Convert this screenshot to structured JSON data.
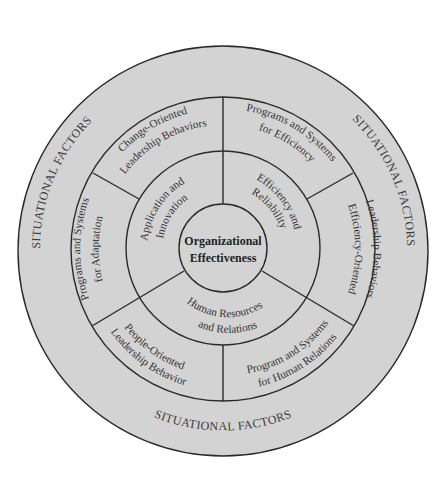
{
  "diagram": {
    "colors": {
      "background": "#ffffff",
      "fill": "#d3d3d3",
      "line": "#2a2a2a",
      "text": "#333333"
    },
    "center": {
      "line1": "Organizational",
      "line2": "Effectiveness"
    },
    "inner_ring": [
      {
        "id": "application-innovation",
        "line1": "Application and",
        "line2": "Innovation"
      },
      {
        "id": "efficiency-reliability",
        "line1": "Efficiency and",
        "line2": "Reliability"
      },
      {
        "id": "human-resources-relations",
        "line1": "Human Resources",
        "line2": "and Relations"
      }
    ],
    "middle_ring": [
      {
        "id": "change-oriented-leadership",
        "line1": "Change-Oriented",
        "line2": "Leadership Behaviors"
      },
      {
        "id": "programs-systems-efficiency",
        "line1": "Programs and Systems",
        "line2": "for Efficiency"
      },
      {
        "id": "efficiency-oriented-leadership",
        "line1": "Efficiency-Oriented",
        "line2": "Leadership Behaviors"
      },
      {
        "id": "programs-systems-human-relations",
        "line1": "Program and Systems",
        "line2": "for Human Relations"
      },
      {
        "id": "people-oriented-leadership",
        "line1": "People-Oriented",
        "line2": "Leadership Behavior"
      },
      {
        "id": "programs-systems-adaptation",
        "line1": "Programs and Systems",
        "line2": "for Adaptation"
      }
    ],
    "outer_ring": {
      "top_left": "SITUATIONAL FACTORS",
      "top_right": "SITUATIONAL FACTORS",
      "bottom": "SITUATIONAL FACTORS"
    }
  }
}
